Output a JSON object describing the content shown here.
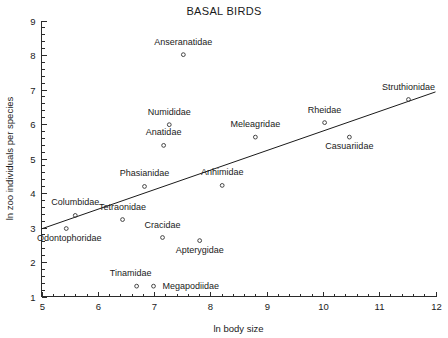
{
  "chart_data": {
    "type": "scatter",
    "title": "BASAL BIRDS",
    "xlabel": "ln body size",
    "ylabel": "ln zoo individuals per species",
    "xlim": [
      5,
      12
    ],
    "ylim": [
      1,
      9
    ],
    "xticks": [
      5,
      6,
      7,
      8,
      9,
      10,
      11,
      12
    ],
    "yticks": [
      1,
      2,
      3,
      4,
      5,
      6,
      7,
      8,
      9
    ],
    "x_minor_step": 0.2,
    "y_minor_step": 0.2,
    "grid": false,
    "legend": "none",
    "points": [
      {
        "label": "Anseranatidae",
        "x": 7.52,
        "y": 8.01,
        "label_dx": 0,
        "label_dy": -10,
        "label_anchor": "middle"
      },
      {
        "label": "Numididae",
        "x": 7.27,
        "y": 5.98,
        "label_dx": 0,
        "label_dy": -10,
        "label_anchor": "middle"
      },
      {
        "label": "Anatidae",
        "x": 7.17,
        "y": 5.38,
        "label_dx": 0,
        "label_dy": -10,
        "label_anchor": "middle"
      },
      {
        "label": "Meleagridae",
        "x": 8.8,
        "y": 5.62,
        "label_dx": 0,
        "label_dy": -10,
        "label_anchor": "middle"
      },
      {
        "label": "Rheidae",
        "x": 10.03,
        "y": 6.04,
        "label_dx": 0,
        "label_dy": -10,
        "label_anchor": "middle"
      },
      {
        "label": "Struthionidae",
        "x": 11.52,
        "y": 6.71,
        "label_dx": 0,
        "label_dy": -10,
        "label_anchor": "middle"
      },
      {
        "label": "Casuariidae",
        "x": 10.47,
        "y": 5.62,
        "label_dx": 0,
        "label_dy": 12,
        "label_anchor": "middle"
      },
      {
        "label": "Phasianidae",
        "x": 6.83,
        "y": 4.19,
        "label_dx": 0,
        "label_dy": -10,
        "label_anchor": "middle"
      },
      {
        "label": "Anhimidae",
        "x": 8.21,
        "y": 4.22,
        "label_dx": 0,
        "label_dy": -10,
        "label_anchor": "middle"
      },
      {
        "label": "Columbidae",
        "x": 5.6,
        "y": 3.35,
        "label_dx": 0,
        "label_dy": -10,
        "label_anchor": "middle"
      },
      {
        "label": "Tetraonidae",
        "x": 6.44,
        "y": 3.23,
        "label_dx": 0,
        "label_dy": -10,
        "label_anchor": "middle"
      },
      {
        "label": "Odontophoridae",
        "x": 5.44,
        "y": 2.97,
        "label_dx": 3,
        "label_dy": 12,
        "label_anchor": "middle"
      },
      {
        "label": "Cracidae",
        "x": 7.15,
        "y": 2.71,
        "label_dx": 0,
        "label_dy": -10,
        "label_anchor": "middle"
      },
      {
        "label": "Apterygidae",
        "x": 7.81,
        "y": 2.62,
        "label_dx": 0,
        "label_dy": 12,
        "label_anchor": "middle"
      },
      {
        "label": "Tinamidae",
        "x": 6.69,
        "y": 1.3,
        "label_dx": -6,
        "label_dy": -10,
        "label_anchor": "middle"
      },
      {
        "label": "Megapodiidae",
        "x": 6.99,
        "y": 1.3,
        "label_dx": 9,
        "label_dy": 3,
        "label_anchor": "start"
      }
    ],
    "trend_line": {
      "x0": 5.0,
      "y0": 2.96,
      "x1": 12.0,
      "y1": 6.93,
      "color": "#1a1a1a"
    }
  }
}
